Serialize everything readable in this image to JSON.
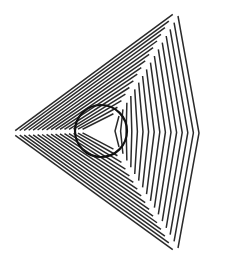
{
  "figure": {
    "title": "Nested triangle line illusion with circle",
    "width": 229,
    "height": 263,
    "background": "#ffffff",
    "stroke_color": "#2a2a2a",
    "stroke_width": 1.5,
    "levels": 16,
    "outer": {
      "left": [
        12,
        133
      ],
      "top": [
        176,
        12
      ],
      "bottom": [
        176,
        252
      ],
      "right_top": [
        214,
        88
      ],
      "right_chevron": [
        199,
        133
      ],
      "right_bottom": [
        214,
        181
      ]
    },
    "inner": {
      "left": [
        79,
        131
      ],
      "top": [
        117,
        112
      ],
      "bottom": [
        117,
        151
      ],
      "right_top": [
        119,
        112
      ],
      "right_chevron": [
        115,
        131
      ],
      "right_bottom": [
        119,
        151
      ]
    },
    "circle": {
      "cx": 101,
      "cy": 131,
      "r": 26,
      "stroke_width": 2.2
    }
  }
}
